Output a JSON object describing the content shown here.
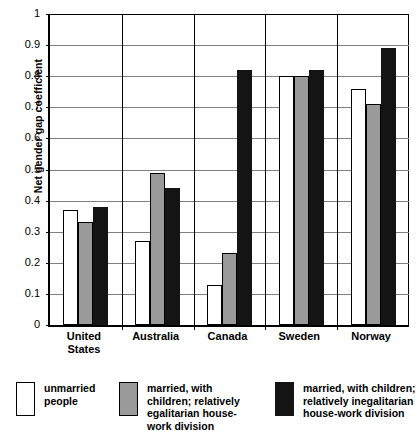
{
  "chart_data": {
    "type": "bar",
    "title": "",
    "xlabel": "",
    "ylabel": "Net gender gap coefficient",
    "ylim": [
      0,
      1
    ],
    "ytick_labels": [
      "0",
      "0.1",
      "0.2",
      "0.3",
      "0.4",
      "0.5",
      "0.6",
      "0.7",
      "0.8",
      "0.9",
      "1"
    ],
    "ytick_values": [
      0,
      0.1,
      0.2,
      0.3,
      0.4,
      0.5,
      0.6,
      0.7,
      0.8,
      0.9,
      1
    ],
    "grid": true,
    "legend_position": "bottom",
    "categories": [
      "United States",
      "Australia",
      "Canada",
      "Sweden",
      "Norway"
    ],
    "series": [
      {
        "name": "unmarried people",
        "color": "#ffffff",
        "values": [
          0.37,
          0.27,
          0.13,
          0.8,
          0.76
        ]
      },
      {
        "name": "married, with children; relatively egalitarian house-work division",
        "color": "#9a9a9a",
        "values": [
          0.33,
          0.49,
          0.23,
          0.8,
          0.71
        ]
      },
      {
        "name": "married, with children; relatively inegalitarian house-work division",
        "color": "#141414",
        "values": [
          0.38,
          0.44,
          0.82,
          0.82,
          0.89
        ]
      }
    ]
  },
  "axis": {
    "y_title": "Net gender gap coefficient"
  },
  "legend": [
    {
      "label": "unmarried\npeople",
      "swatch": "white-swatch"
    },
    {
      "label": "married, with\nchildren; relatively\negalitarian house-\nwork division",
      "swatch": "gray-swatch"
    },
    {
      "label": "married, with children;\nrelatively inegalitarian\nhouse-work division",
      "swatch": "black-swatch"
    }
  ],
  "category_labels": [
    "United\nStates",
    "Australia",
    "Canada",
    "Sweden",
    "Norway"
  ]
}
